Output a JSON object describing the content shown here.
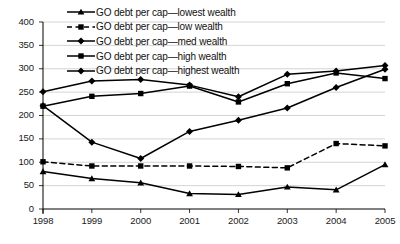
{
  "chart_data": {
    "type": "line",
    "title": "",
    "xlabel": "",
    "ylabel": "",
    "categories": [
      "1998",
      "1999",
      "2000",
      "2001",
      "2002",
      "2003",
      "2004",
      "2005"
    ],
    "x": [
      1998,
      1999,
      2000,
      2001,
      2002,
      2003,
      2004,
      2005
    ],
    "ylim": [
      0,
      400
    ],
    "yticks": [
      0,
      50,
      100,
      150,
      200,
      250,
      300,
      350,
      400
    ],
    "ytick_labels": [
      "0",
      "50",
      "100",
      "150",
      "200",
      "250",
      "300",
      "350",
      "400"
    ],
    "grid": "horizontal",
    "legend_position": "top-center",
    "series": [
      {
        "name": "GO debt per cap—lowest wealth",
        "marker": "triangle",
        "line_style": "solid",
        "color": "#000000",
        "values": [
          80,
          65,
          56,
          33,
          31,
          47,
          41,
          95
        ]
      },
      {
        "name": "GO debt per cap—low wealth",
        "marker": "square",
        "line_style": "dashed",
        "color": "#000000",
        "values": [
          101,
          92,
          92,
          92,
          91,
          88,
          140,
          135
        ]
      },
      {
        "name": "GO debt per cap—med wealth",
        "marker": "diamond",
        "line_style": "solid",
        "color": "#000000",
        "values": [
          221,
          143,
          108,
          166,
          190,
          216,
          260,
          299
        ]
      },
      {
        "name": "GO debt per cap—high wealth",
        "marker": "square",
        "line_style": "solid",
        "color": "#000000",
        "values": [
          220,
          241,
          247,
          263,
          229,
          268,
          291,
          279
        ]
      },
      {
        "name": "GO debt per cap—highest wealth",
        "marker": "diamond",
        "line_style": "solid",
        "color": "#000000",
        "values": [
          251,
          274,
          277,
          265,
          240,
          288,
          295,
          307
        ]
      }
    ]
  },
  "legend": {
    "items": [
      {
        "label": "GO debt per cap—lowest wealth"
      },
      {
        "label": "GO debt per cap—low wealth"
      },
      {
        "label": "GO debt per cap—med wealth"
      },
      {
        "label": "GO debt per cap—high wealth"
      },
      {
        "label": "GO debt per cap—highest wealth"
      }
    ]
  },
  "axes": {
    "y_labels": [
      "400",
      "350",
      "300",
      "250",
      "200",
      "150",
      "100",
      "50",
      "0"
    ],
    "x_labels": [
      "1998",
      "1999",
      "2000",
      "2001",
      "2002",
      "2003",
      "2004",
      "2005"
    ]
  }
}
